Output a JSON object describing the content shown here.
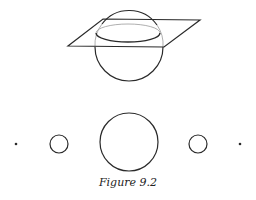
{
  "figure": {
    "caption": "Figure 9.2",
    "stroke_color": "#2a2a2a",
    "top_diagram": {
      "description": "sphere intersected by a plane",
      "plane": [
        [
          103,
          19
        ],
        [
          200,
          20
        ],
        [
          164,
          47
        ],
        [
          68,
          46
        ]
      ],
      "sphere": {
        "cx": 129,
        "cy": 48,
        "r": 34
      },
      "section_ellipse": {
        "cx": 128,
        "cy": 33,
        "rx": 32,
        "ry": 9
      }
    },
    "bottom_row": [
      {
        "type": "dot",
        "cx": 16,
        "cy": 144,
        "r": 1.3
      },
      {
        "type": "circle",
        "cx": 59,
        "cy": 144,
        "r": 9
      },
      {
        "type": "circle",
        "cx": 129,
        "cy": 142,
        "r": 29
      },
      {
        "type": "circle",
        "cx": 198,
        "cy": 144,
        "r": 9
      },
      {
        "type": "dot",
        "cx": 240,
        "cy": 144,
        "r": 1.3
      }
    ]
  }
}
